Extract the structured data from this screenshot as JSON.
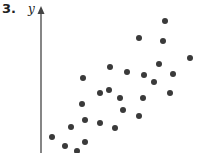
{
  "problem_number": "3.",
  "chart_data": {
    "type": "scatter",
    "title": "",
    "xlabel": "",
    "ylabel": "y",
    "grid": false,
    "legend": null,
    "axes": {
      "y_axis_x": 41,
      "y_axis_top": 9,
      "y_axis_bottom": 153,
      "arrow": "up"
    },
    "point_color": "#3a3a3a",
    "point_radius": 3,
    "points_px": [
      [
        52,
        137
      ],
      [
        65,
        146
      ],
      [
        71,
        127
      ],
      [
        77,
        151
      ],
      [
        85,
        120
      ],
      [
        85,
        142
      ],
      [
        82,
        104
      ],
      [
        83,
        78
      ],
      [
        100,
        93
      ],
      [
        109,
        90
      ],
      [
        110,
        67
      ],
      [
        127,
        72
      ],
      [
        120,
        98
      ],
      [
        123,
        110
      ],
      [
        100,
        123
      ],
      [
        115,
        128
      ],
      [
        139,
        116
      ],
      [
        143,
        98
      ],
      [
        144,
        75
      ],
      [
        139,
        38
      ],
      [
        165,
        21
      ],
      [
        163,
        41
      ],
      [
        159,
        64
      ],
      [
        190,
        58
      ],
      [
        173,
        74
      ],
      [
        154,
        82
      ],
      [
        170,
        93
      ]
    ],
    "trend": "positive correlation"
  }
}
